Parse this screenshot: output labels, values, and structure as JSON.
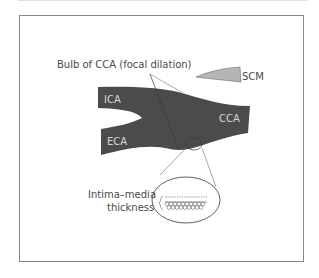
{
  "diagram": {
    "type": "anatomical-illustration",
    "labels": {
      "bulb": "Bulb of CCA (focal dilation)",
      "scm": "SCM",
      "ica": "ICA",
      "eca": "ECA",
      "cca": "CCA",
      "imt_line1": "Intima–media",
      "imt_line2": "thickness"
    },
    "colors": {
      "vessel": "#4b4b4b",
      "scm": "#b5b5b5",
      "frame": "#8a8a8a",
      "text": "#4a4a4a",
      "text_on_vessel": "#d8d8d8",
      "leader_lines": "#6a6a6a"
    }
  }
}
